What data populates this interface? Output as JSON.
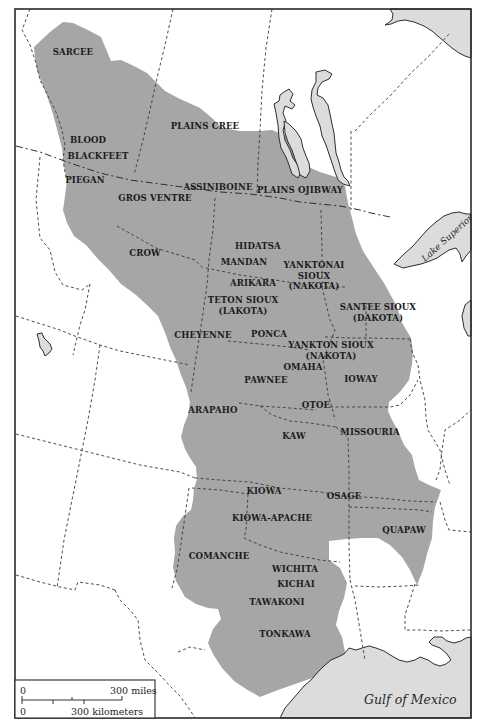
{
  "map": {
    "colors": {
      "territory": "#a6a6a6",
      "water": "#dcdcdc",
      "background": "#ffffff",
      "border": "#3a3a3a",
      "text": "#1c1c1c"
    },
    "tribes": [
      {
        "id": "sarcee",
        "lines": [
          "SARCEE"
        ],
        "x": 73,
        "y": 55
      },
      {
        "id": "plains-cree",
        "lines": [
          "PLAINS CREE"
        ],
        "x": 205,
        "y": 129
      },
      {
        "id": "blood",
        "lines": [
          "BLOOD"
        ],
        "x": 88,
        "y": 143
      },
      {
        "id": "blackfeet",
        "lines": [
          "BLACKFEET"
        ],
        "x": 98,
        "y": 159
      },
      {
        "id": "piegan",
        "lines": [
          "PIEGAN"
        ],
        "x": 85,
        "y": 183
      },
      {
        "id": "assiniboine",
        "lines": [
          "ASSINIBOINE"
        ],
        "x": 218,
        "y": 190
      },
      {
        "id": "plains-ojibway",
        "lines": [
          "PLAINS OJIBWAY"
        ],
        "x": 300,
        "y": 193
      },
      {
        "id": "gros-ventre",
        "lines": [
          "GROS VENTRE"
        ],
        "x": 155,
        "y": 201
      },
      {
        "id": "crow",
        "lines": [
          "CROW"
        ],
        "x": 145,
        "y": 256
      },
      {
        "id": "hidatsa",
        "lines": [
          "HIDATSA"
        ],
        "x": 258,
        "y": 249
      },
      {
        "id": "mandan",
        "lines": [
          "MANDAN"
        ],
        "x": 244,
        "y": 265
      },
      {
        "id": "yanktonai-sioux",
        "lines": [
          "YANKTONAI",
          "SIOUX",
          "(NAKOTA)"
        ],
        "x": 314,
        "y": 268
      },
      {
        "id": "arikara",
        "lines": [
          "ARIKARA"
        ],
        "x": 253,
        "y": 286
      },
      {
        "id": "teton-sioux",
        "lines": [
          "TETON SIOUX",
          "(LAKOTA)"
        ],
        "x": 243,
        "y": 303
      },
      {
        "id": "santee-sioux",
        "lines": [
          "SANTEE SIOUX",
          "(DAKOTA)"
        ],
        "x": 378,
        "y": 310
      },
      {
        "id": "cheyenne",
        "lines": [
          "CHEYENNE"
        ],
        "x": 203,
        "y": 338
      },
      {
        "id": "ponca",
        "lines": [
          "PONCA"
        ],
        "x": 269,
        "y": 337
      },
      {
        "id": "yankton-sioux",
        "lines": [
          "YANKTON SIOUX",
          "(NAKOTA)"
        ],
        "x": 331,
        "y": 348
      },
      {
        "id": "omaha",
        "lines": [
          "OMAHA"
        ],
        "x": 303,
        "y": 370
      },
      {
        "id": "pawnee",
        "lines": [
          "PAWNEE"
        ],
        "x": 266,
        "y": 383
      },
      {
        "id": "ioway",
        "lines": [
          "IOWAY"
        ],
        "x": 361,
        "y": 382
      },
      {
        "id": "arapaho",
        "lines": [
          "ARAPAHO"
        ],
        "x": 213,
        "y": 413
      },
      {
        "id": "otoe",
        "lines": [
          "OTOE"
        ],
        "x": 316,
        "y": 408
      },
      {
        "id": "missouria",
        "lines": [
          "MISSOURIA"
        ],
        "x": 370,
        "y": 435
      },
      {
        "id": "kaw",
        "lines": [
          "KAW"
        ],
        "x": 294,
        "y": 439
      },
      {
        "id": "kiowa",
        "lines": [
          "KIOWA"
        ],
        "x": 264,
        "y": 494
      },
      {
        "id": "osage",
        "lines": [
          "OSAGE"
        ],
        "x": 344,
        "y": 499
      },
      {
        "id": "kiowa-apache",
        "lines": [
          "KIOWA-APACHE"
        ],
        "x": 272,
        "y": 521
      },
      {
        "id": "quapaw",
        "lines": [
          "QUAPAW"
        ],
        "x": 404,
        "y": 533
      },
      {
        "id": "comanche",
        "lines": [
          "COMANCHE"
        ],
        "x": 219,
        "y": 559
      },
      {
        "id": "wichita",
        "lines": [
          "WICHITA"
        ],
        "x": 295,
        "y": 572
      },
      {
        "id": "kichai",
        "lines": [
          "KICHAI"
        ],
        "x": 296,
        "y": 587
      },
      {
        "id": "tawakoni",
        "lines": [
          "TAWAKONI"
        ],
        "x": 277,
        "y": 605
      },
      {
        "id": "tonkawa",
        "lines": [
          "TONKAWA"
        ],
        "x": 285,
        "y": 637
      }
    ],
    "water_labels": {
      "lake_superior": "Lake Superior",
      "gulf_of_mexico": "Gulf of Mexico"
    },
    "scale": {
      "miles_zero": "0",
      "miles_label": "300 miles",
      "km_zero": "0",
      "km_label": "300 kilometers"
    }
  }
}
